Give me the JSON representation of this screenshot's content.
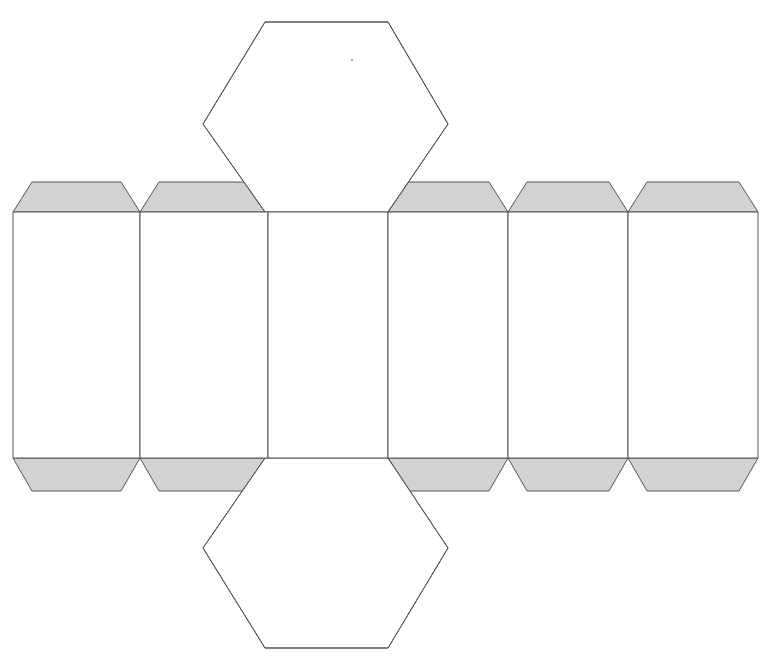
{
  "document": {
    "title": "Hexagonal Prism Net",
    "type": "papercraft-fold-template",
    "background_color": "#ffffff",
    "canvas": {
      "width": 775,
      "height": 660
    }
  },
  "style": {
    "stroke_color": "#555555",
    "stroke_width": 1,
    "panel_fill": "#ffffff",
    "tab_fill": "#d2d2d2",
    "hex_fill": "#ffffff",
    "speck_color": "#b8b0b0"
  },
  "geometry": {
    "panel_top_y": 212,
    "panel_bottom_y": 458,
    "tab_top_y": 182,
    "tab_bottom_y": 491,
    "tab_inset": 19,
    "panel_edges_x": [
      13,
      140,
      268,
      388,
      508,
      628,
      758
    ],
    "panels": [
      {
        "name": "side-panel-1",
        "x_left": 13,
        "x_right": 140,
        "has_top_tab": true,
        "has_bottom_tab": true
      },
      {
        "name": "side-panel-2",
        "x_left": 140,
        "x_right": 268,
        "has_top_tab": true,
        "has_bottom_tab": true
      },
      {
        "name": "side-panel-3",
        "x_left": 268,
        "x_right": 388,
        "has_top_tab": false,
        "has_bottom_tab": false
      },
      {
        "name": "side-panel-4",
        "x_left": 388,
        "x_right": 508,
        "has_top_tab": true,
        "has_bottom_tab": true
      },
      {
        "name": "side-panel-5",
        "x_left": 508,
        "x_right": 628,
        "has_top_tab": true,
        "has_bottom_tab": true
      },
      {
        "name": "side-panel-6",
        "x_left": 628,
        "x_right": 758,
        "has_top_tab": true,
        "has_bottom_tab": true
      }
    ],
    "hexagons": [
      {
        "name": "top-hexagon-face",
        "position": "top",
        "center_x": 326,
        "points": "265,22 388,22 448,124 388,212 265,212 203,124"
      },
      {
        "name": "bottom-hexagon-face",
        "position": "bottom",
        "center_x": 326,
        "points": "265,458 388,458 448,548 388,648 265,648 203,548"
      }
    ],
    "speck": {
      "x": 352,
      "y": 60,
      "r": 1.2
    }
  },
  "labels": {
    "alt_text": "Net of a hexagonal prism with six rectangular side faces, two hexagonal end faces, and shaded glue tabs"
  }
}
